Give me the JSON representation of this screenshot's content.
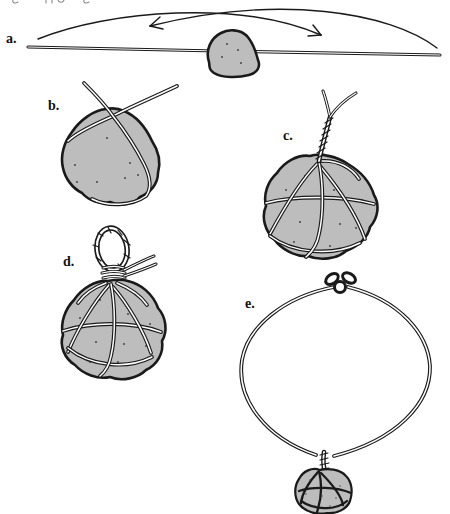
{
  "figure": {
    "colors": {
      "ink": "#1a1a1a",
      "stone_fill": "#bdbdbd",
      "paper": "#ffffff"
    },
    "steps": [
      {
        "id": "a",
        "label": "a."
      },
      {
        "id": "b",
        "label": "b."
      },
      {
        "id": "c",
        "label": "c."
      },
      {
        "id": "d",
        "label": "d."
      },
      {
        "id": "e",
        "label": "e."
      }
    ]
  }
}
